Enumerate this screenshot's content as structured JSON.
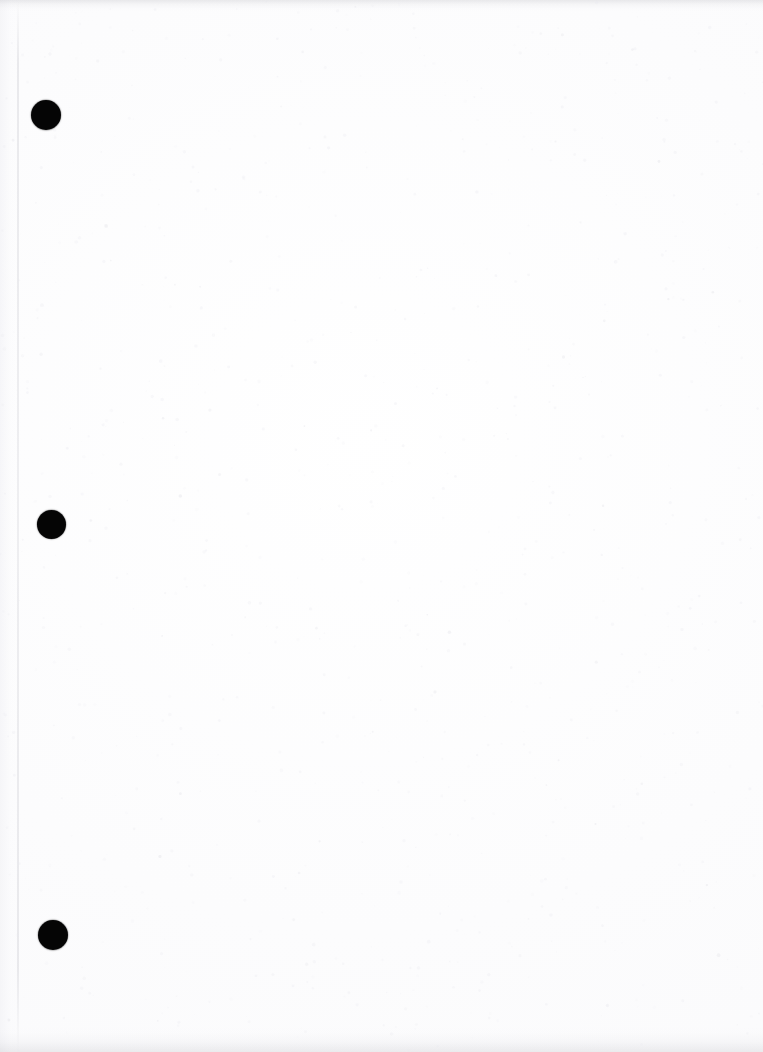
{
  "document": {
    "kind": "scanned-blank-page",
    "page_width": 763,
    "page_height": 1052,
    "background_color": "#fcfcfd",
    "ink_color": "#050505",
    "visible_text": "",
    "text_content_present": false,
    "description": "Blank scanned document page with three solid black circular marks down the left margin"
  },
  "marks": {
    "label": "left-margin bullet marks",
    "count": 3,
    "shape": "filled-circle",
    "color": "#050505",
    "items": [
      {
        "index": 1,
        "cx": 46,
        "cy": 115,
        "diameter": 30
      },
      {
        "index": 2,
        "cx": 51,
        "cy": 524,
        "diameter": 29
      },
      {
        "index": 3,
        "cx": 53,
        "cy": 935,
        "diameter": 30
      }
    ]
  },
  "artifacts": {
    "gutter_line": {
      "x": 17,
      "color": "#c0c0c8"
    },
    "top_edge_band": {
      "height": 12,
      "color": "#a0a0a8"
    },
    "bottom_edge_band": {
      "height": 26,
      "color": "#a8a8b0"
    },
    "speckle_color": "#e8e8ee"
  }
}
